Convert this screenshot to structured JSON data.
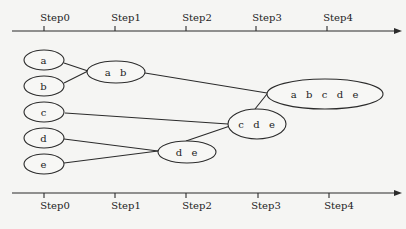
{
  "diagram": {
    "type": "agglomerative-hierarchical-clustering",
    "axes": {
      "top": {
        "labels": [
          "Step0",
          "Step1",
          "Step2",
          "Step3",
          "Step4"
        ]
      },
      "bottom": {
        "labels": [
          "Step0",
          "Step1",
          "Step2",
          "Step3",
          "Step4"
        ]
      }
    },
    "nodes": [
      {
        "id": "a",
        "label": "a"
      },
      {
        "id": "b",
        "label": "b"
      },
      {
        "id": "c",
        "label": "c"
      },
      {
        "id": "d",
        "label": "d"
      },
      {
        "id": "e",
        "label": "e"
      },
      {
        "id": "ab",
        "label": "a  b"
      },
      {
        "id": "de",
        "label": "d  e"
      },
      {
        "id": "cde",
        "label": "c  d  e"
      },
      {
        "id": "abcde",
        "label": "a  b  c  d  e"
      }
    ],
    "edges": [
      {
        "from": "a",
        "to": "ab"
      },
      {
        "from": "b",
        "to": "ab"
      },
      {
        "from": "d",
        "to": "de"
      },
      {
        "from": "e",
        "to": "de"
      },
      {
        "from": "c",
        "to": "cde"
      },
      {
        "from": "de",
        "to": "cde"
      },
      {
        "from": "ab",
        "to": "abcde"
      },
      {
        "from": "cde",
        "to": "abcde"
      }
    ]
  }
}
